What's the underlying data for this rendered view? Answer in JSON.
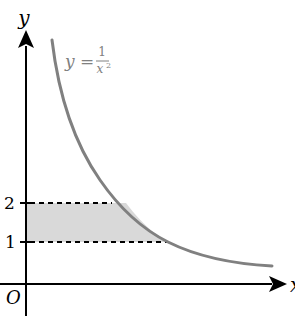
{
  "diagram": {
    "type": "function-graph",
    "axes": {
      "x_label": "x",
      "y_label": "y",
      "origin_label": "O"
    },
    "curve": {
      "equation_lhs": "y =",
      "equation_numerator": "1",
      "equation_denominator": "x",
      "equation_denominator_exponent": "2",
      "color": "#808080"
    },
    "y_ticks": [
      {
        "label": "2",
        "value": 2
      },
      {
        "label": "1",
        "value": 1
      }
    ],
    "shaded_region": {
      "description": "Region between y=1 and y=2, left of the curve, right of the y-axis",
      "y_from": 1,
      "y_to": 2,
      "fill": "#d9d9d9"
    },
    "colors": {
      "axis": "#000000",
      "curve": "#808080",
      "shade": "#d9d9d9",
      "dashed": "#000000"
    }
  }
}
